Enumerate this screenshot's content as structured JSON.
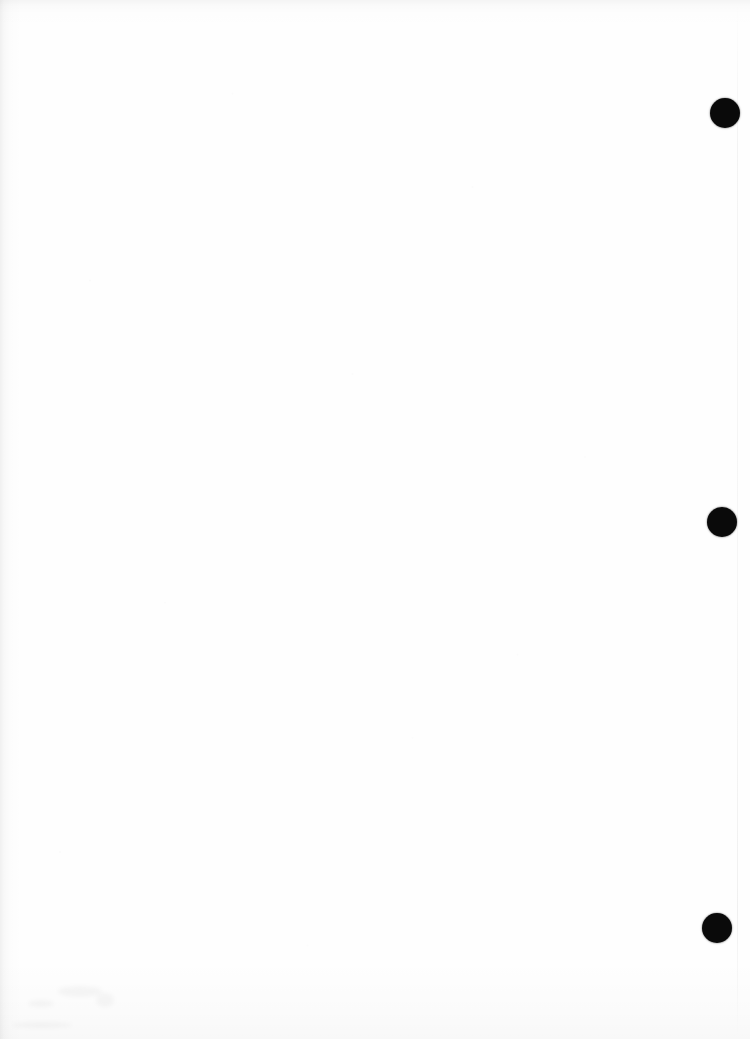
{
  "page": {
    "width_px": 750,
    "height_px": 1039,
    "orientation": "portrait",
    "background_color": "#fefefe",
    "content_text": "",
    "note": "Blank scanned sheet - no printed text or figures present"
  },
  "marks": {
    "ink_color": "#0a0a0a",
    "shape": "circle",
    "count": 3,
    "placement": "right margin, vertical column",
    "items": [
      {
        "id": "dot-1",
        "cx": 725,
        "cy": 113,
        "diameter": 30
      },
      {
        "id": "dot-2",
        "cx": 722,
        "cy": 522,
        "diameter": 30
      },
      {
        "id": "dot-3",
        "cx": 717,
        "cy": 928,
        "diameter": 30
      }
    ]
  },
  "artifacts": {
    "edge_line_color": "#e6e6e6",
    "edge_line_x": 737,
    "smudges": [
      {
        "id": "smudge-1",
        "x": 28,
        "y": 1000,
        "w": 26,
        "h": 7
      },
      {
        "id": "smudge-2",
        "x": 58,
        "y": 986,
        "w": 44,
        "h": 11
      },
      {
        "id": "smudge-3",
        "x": 96,
        "y": 993,
        "w": 18,
        "h": 14
      },
      {
        "id": "smudge-4",
        "x": 12,
        "y": 1022,
        "w": 60,
        "h": 6
      }
    ]
  }
}
